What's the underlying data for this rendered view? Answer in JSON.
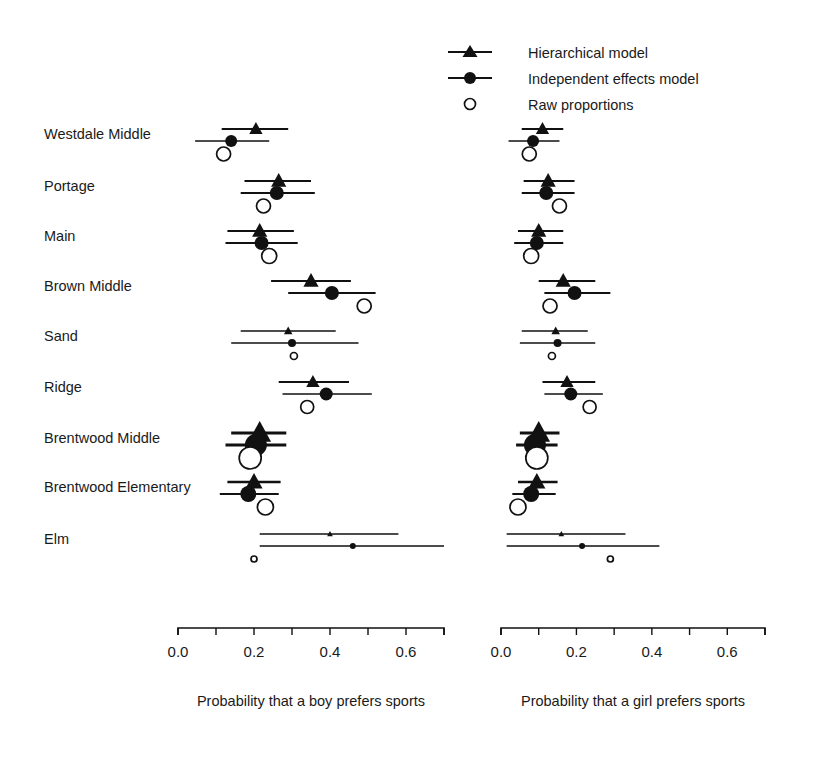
{
  "legend": {
    "position": "top-right",
    "items": [
      {
        "label": "Hierarchical model",
        "marker": "triangle-with-line",
        "icon_name": "legend-triangle-icon"
      },
      {
        "label": "Independent effects model",
        "marker": "circle-with-line",
        "icon_name": "legend-filled-circle-icon"
      },
      {
        "label": "Raw proportions",
        "marker": "open-circle",
        "icon_name": "legend-open-circle-icon"
      }
    ]
  },
  "schools": [
    "Westdale Middle",
    "Portage",
    "Main",
    "Brown Middle",
    "Sand",
    "Ridge",
    "Brentwood Middle",
    "Brentwood Elementary",
    "Elm"
  ],
  "panels": [
    {
      "id": "boys",
      "xlabel": "Probability that a boy prefers sports",
      "xlim": [
        0.0,
        0.7
      ],
      "ticks": [
        0.0,
        0.1,
        0.2,
        0.3,
        0.4,
        0.5,
        0.6,
        0.7
      ],
      "tick_labels": [
        "0.0",
        "",
        "0.2",
        "",
        "0.4",
        "",
        "0.6",
        ""
      ]
    },
    {
      "id": "girls",
      "xlabel": "Probability that a girl prefers sports",
      "xlim": [
        0.0,
        0.7
      ],
      "ticks": [
        0.0,
        0.1,
        0.2,
        0.3,
        0.4,
        0.5,
        0.6,
        0.7
      ],
      "tick_labels": [
        "0.0",
        "",
        "0.2",
        "",
        "0.4",
        "",
        "0.6",
        ""
      ]
    }
  ],
  "chart_data": {
    "type": "scatter",
    "title": "",
    "subtitle": "",
    "grid": false,
    "legend_position": "top-right",
    "xlabel": "Probability that a boy prefers sports / Probability that a girl prefers sports",
    "ylabel": "",
    "xlim": [
      0.0,
      0.7
    ],
    "categories": [
      "Westdale Middle",
      "Portage",
      "Main",
      "Brown Middle",
      "Sand",
      "Ridge",
      "Brentwood Middle",
      "Brentwood Elementary",
      "Elm"
    ],
    "panels": [
      {
        "name": "boys",
        "xlabel": "Probability that a boy prefers sports",
        "series": [
          {
            "name": "Hierarchical model",
            "marker": "triangle",
            "values": [
              0.205,
              0.265,
              0.215,
              0.35,
              0.29,
              0.355,
              0.215,
              0.2,
              0.4
            ],
            "ci_low": [
              0.115,
              0.175,
              0.13,
              0.245,
              0.165,
              0.265,
              0.14,
              0.13,
              0.215
            ],
            "ci_high": [
              0.29,
              0.35,
              0.305,
              0.455,
              0.415,
              0.45,
              0.285,
              0.27,
              0.58
            ],
            "marker_sizes": [
              7,
              8,
              8,
              8,
              4.5,
              7,
              12,
              9,
              3
            ]
          },
          {
            "name": "Independent effects model",
            "marker": "filled-circle",
            "values": [
              0.14,
              0.26,
              0.22,
              0.405,
              0.3,
              0.39,
              0.205,
              0.185,
              0.46
            ],
            "ci_low": [
              0.045,
              0.165,
              0.125,
              0.29,
              0.14,
              0.275,
              0.125,
              0.11,
              0.215
            ],
            "ci_high": [
              0.24,
              0.36,
              0.315,
              0.52,
              0.475,
              0.51,
              0.285,
              0.265,
              0.7
            ],
            "marker_sizes": [
              6,
              7,
              7,
              7,
              4,
              6.5,
              11,
              8,
              3
            ]
          },
          {
            "name": "Raw proportions",
            "marker": "open-circle",
            "values": [
              0.12,
              0.225,
              0.24,
              0.49,
              0.305,
              0.34,
              0.19,
              0.23,
              0.2
            ],
            "marker_sizes": [
              7,
              7,
              7.5,
              7,
              3.5,
              6.5,
              11,
              8,
              3
            ]
          }
        ]
      },
      {
        "name": "girls",
        "xlabel": "Probability that a girl prefers sports",
        "series": [
          {
            "name": "Hierarchical model",
            "marker": "triangle",
            "values": [
              0.11,
              0.125,
              0.1,
              0.165,
              0.145,
              0.175,
              0.1,
              0.095,
              0.16
            ],
            "ci_low": [
              0.055,
              0.06,
              0.045,
              0.1,
              0.055,
              0.11,
              0.05,
              0.045,
              0.015
            ],
            "ci_high": [
              0.165,
              0.195,
              0.165,
              0.25,
              0.23,
              0.25,
              0.155,
              0.15,
              0.33
            ],
            "marker_sizes": [
              7,
              8,
              8,
              8,
              4.5,
              7,
              12,
              9,
              3
            ]
          },
          {
            "name": "Independent effects model",
            "marker": "filled-circle",
            "values": [
              0.085,
              0.12,
              0.095,
              0.195,
              0.15,
              0.185,
              0.09,
              0.08,
              0.215
            ],
            "ci_low": [
              0.02,
              0.055,
              0.035,
              0.115,
              0.05,
              0.115,
              0.04,
              0.03,
              0.015
            ],
            "ci_high": [
              0.155,
              0.195,
              0.165,
              0.29,
              0.25,
              0.27,
              0.15,
              0.145,
              0.42
            ],
            "marker_sizes": [
              6,
              7,
              7,
              7,
              4,
              6.5,
              11,
              8,
              3
            ]
          },
          {
            "name": "Raw proportions",
            "marker": "open-circle",
            "values": [
              0.075,
              0.155,
              0.08,
              0.13,
              0.135,
              0.235,
              0.095,
              0.045,
              0.29
            ],
            "marker_sizes": [
              7,
              7,
              7.5,
              7,
              3.5,
              6.5,
              11,
              8,
              3
            ]
          }
        ]
      }
    ]
  }
}
